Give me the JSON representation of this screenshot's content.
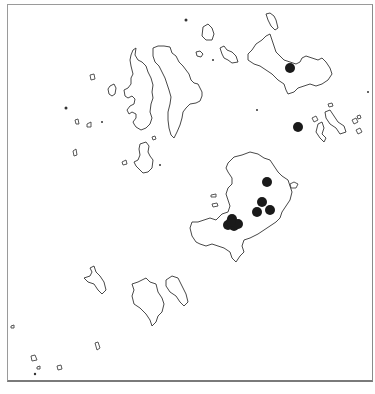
{
  "map": {
    "title": "",
    "feature_type": "island coastline outlines",
    "marker_style": "filled black circle",
    "marker_color": "#1a1a1a",
    "coastline_color": "#333333",
    "background_color": "#ffffff",
    "site_markers": {
      "count": 11,
      "groups": [
        {
          "name": "north-east-island-site",
          "count": 1
        },
        {
          "name": "east-islet-site",
          "count": 1
        },
        {
          "name": "central-island-sites-east",
          "count": 4
        },
        {
          "name": "central-island-sites-west-cluster",
          "count": 5
        }
      ]
    }
  }
}
